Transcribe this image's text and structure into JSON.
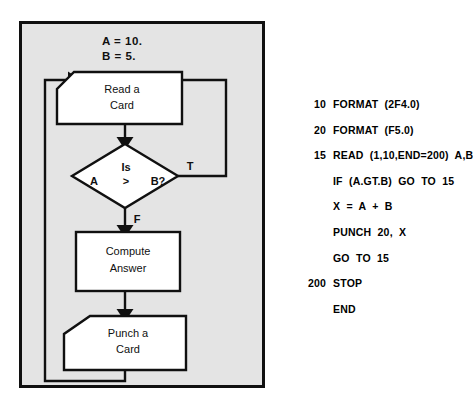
{
  "figure": {
    "panel": {
      "background_color": "#e4e4e4",
      "border_color": "#101010"
    },
    "initialization": {
      "line1": "A  =  10.",
      "line2": "B  =  5."
    },
    "nodes": {
      "read_card": {
        "line1": "Read  a",
        "line2": "Card",
        "shape": "punched-card"
      },
      "decision": {
        "top": "Is",
        "left": "A",
        "middle": ">",
        "right": "B?",
        "shape": "diamond"
      },
      "compute": {
        "line1": "Compute",
        "line2": "Answer",
        "shape": "rectangle"
      },
      "punch_card": {
        "line1": "Punch  a",
        "line2": "Card",
        "shape": "punched-card"
      }
    },
    "branch_labels": {
      "true_label": "T",
      "false_label": "F"
    }
  },
  "code": {
    "lines": [
      {
        "label": "10",
        "statement": "FORMAT  (2F4.0)"
      },
      {
        "label": "20",
        "statement": "FORMAT  (F5.0)"
      },
      {
        "label": "15",
        "statement": "READ  (1,10,END=200)  A,B"
      },
      {
        "label": "",
        "statement": "IF  (A.GT.B)  GO  TO  15"
      },
      {
        "label": "",
        "statement": "X  =  A  +  B"
      },
      {
        "label": "",
        "statement": "PUNCH  20,  X"
      },
      {
        "label": "",
        "statement": "GO  TO  15"
      },
      {
        "label": "200",
        "statement": "STOP"
      },
      {
        "label": "",
        "statement": "END"
      }
    ]
  }
}
